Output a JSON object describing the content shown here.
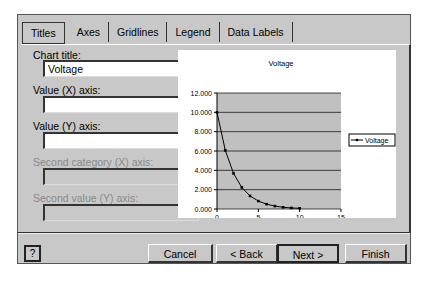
{
  "tabs": [
    {
      "label": "Titles",
      "active": true
    },
    {
      "label": "Axes"
    },
    {
      "label": "Gridlines"
    },
    {
      "label": "Legend"
    },
    {
      "label": "Data Labels"
    }
  ],
  "fields": {
    "chart_title": {
      "label": "Chart title:",
      "value": "Voltage"
    },
    "value_x_axis": {
      "label": "Value (X) axis:",
      "value": ""
    },
    "value_y_axis": {
      "label": "Value (Y) axis:",
      "value": ""
    },
    "second_category_x_axis": {
      "label": "Second category (X) axis:",
      "value": "",
      "disabled": true
    },
    "second_value_y_axis": {
      "label": "Second value (Y) axis:",
      "value": "",
      "disabled": true
    }
  },
  "buttons": {
    "help": "?",
    "cancel": "Cancel",
    "back": "< Back",
    "next": "Next >",
    "finish": "Finish"
  },
  "chart_data": {
    "type": "scatter",
    "title": "Voltage",
    "xlabel": "",
    "ylabel": "",
    "x": [
      0,
      1,
      2,
      3,
      4,
      5,
      6,
      7,
      8,
      9,
      10
    ],
    "series": [
      {
        "name": "Voltage",
        "values": [
          10.0,
          6.07,
          3.68,
          2.23,
          1.35,
          0.82,
          0.5,
          0.3,
          0.18,
          0.11,
          0.07
        ]
      }
    ],
    "x_ticks": [
      "0",
      "5",
      "10",
      "15"
    ],
    "y_ticks": [
      "0.000",
      "2.000",
      "4.000",
      "6.000",
      "8.000",
      "10.000",
      "12.000"
    ],
    "xlim": [
      0,
      15
    ],
    "ylim": [
      0,
      12
    ],
    "grid": true,
    "legend_position": "right",
    "plot_area_color": "#c0c0c0"
  }
}
